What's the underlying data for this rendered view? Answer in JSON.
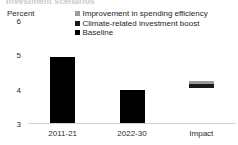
{
  "chart_data": {
    "type": "bar",
    "title": "Investment scenarios",
    "xlabel": "",
    "ylabel": "Percent",
    "ylim": [
      3,
      6
    ],
    "yticks": [
      6,
      5,
      4,
      3
    ],
    "grid": false,
    "stacked": true,
    "legend_position": "top-right",
    "categories": [
      "2011-21",
      "2022-30",
      "Impact"
    ],
    "series": [
      {
        "name": "Baseline",
        "color": "#000000",
        "values": [
          4.95,
          4.0,
          null
        ]
      },
      {
        "name": "Climate-related investment boost",
        "color": "#1a1a1a",
        "values": [
          null,
          null,
          0.12
        ]
      },
      {
        "name": "Improvement in spending efficiency",
        "color": "#9a9a9a",
        "values": [
          null,
          null,
          0.08
        ]
      }
    ],
    "bars": [
      {
        "category": "2011-21",
        "base": 3.0,
        "top": 4.95,
        "segments": [
          {
            "series": "Baseline",
            "from": 3.0,
            "to": 4.95,
            "color": "#000000"
          }
        ]
      },
      {
        "category": "2022-30",
        "base": 3.0,
        "top": 4.0,
        "segments": [
          {
            "series": "Baseline",
            "from": 3.0,
            "to": 4.0,
            "color": "#000000"
          }
        ]
      },
      {
        "category": "Impact",
        "base": 4.05,
        "top": 4.25,
        "segments": [
          {
            "series": "Improvement in spending efficiency",
            "from": 4.17,
            "to": 4.25,
            "color": "#9a9a9a"
          },
          {
            "series": "Climate-related investment boost",
            "from": 4.05,
            "to": 4.17,
            "color": "#1a1a1a"
          }
        ]
      }
    ]
  },
  "axis": {
    "unit_label": "Percent",
    "tick_6": "6",
    "tick_5": "5",
    "tick_4": "4",
    "tick_3": "3"
  },
  "legend": {
    "items": [
      {
        "label": "Improvement in spending efficiency",
        "color": "#9a9a9a"
      },
      {
        "label": "Climate-related investment boost",
        "color": "#1a1a1a"
      },
      {
        "label": "Baseline",
        "color": "#000000"
      }
    ]
  },
  "xaxis": {
    "cat_1": "2011-21",
    "cat_2": "2022-30",
    "cat_3": "Impact"
  },
  "colors": {
    "baseline": "#000000",
    "climate_boost": "#1a1a1a",
    "efficiency": "#9a9a9a",
    "axis_line": "#d2d2d2",
    "text": "#2b2b2b",
    "background": "#ffffff"
  }
}
